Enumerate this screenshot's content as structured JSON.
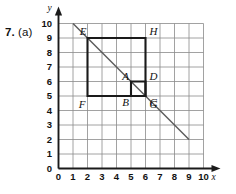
{
  "question": {
    "number": "7.",
    "part": "(a)"
  },
  "chart_data": {
    "type": "scatter",
    "title": "",
    "xlabel": "x",
    "ylabel": "y",
    "xlim": [
      0,
      10
    ],
    "ylim": [
      0,
      10
    ],
    "grid": true,
    "legend": "none",
    "xticks": [
      "0",
      "1",
      "2",
      "3",
      "4",
      "5",
      "6",
      "7",
      "8",
      "9",
      "10"
    ],
    "yticks": [
      "0",
      "1",
      "2",
      "3",
      "4",
      "5",
      "6",
      "7",
      "8",
      "9",
      "10"
    ],
    "shapes": [
      {
        "name": "square-EFGH",
        "kind": "square",
        "vertices": [
          {
            "label": "E",
            "x": 2,
            "y": 9
          },
          {
            "label": "H",
            "x": 6,
            "y": 9
          },
          {
            "label": "G",
            "x": 6,
            "y": 5
          },
          {
            "label": "F",
            "x": 2,
            "y": 5
          }
        ],
        "side": 4
      },
      {
        "name": "square-ABCD",
        "kind": "square",
        "vertices": [
          {
            "label": "A",
            "x": 5,
            "y": 6
          },
          {
            "label": "D",
            "x": 6,
            "y": 6
          },
          {
            "label": "C",
            "x": 6,
            "y": 5
          },
          {
            "label": "B",
            "x": 5,
            "y": 5
          }
        ],
        "side": 1
      }
    ],
    "lines": [
      {
        "name": "diagonal-line",
        "from": {
          "x": 1,
          "y": 10
        },
        "to": {
          "x": 9,
          "y": 2
        },
        "slope": -1,
        "intercept": 11
      }
    ],
    "point_labels": [
      {
        "label": "E",
        "x": 2,
        "y": 9
      },
      {
        "label": "H",
        "x": 6,
        "y": 9
      },
      {
        "label": "F",
        "x": 2,
        "y": 5
      },
      {
        "label": "G",
        "x": 6,
        "y": 5
      },
      {
        "label": "A",
        "x": 5,
        "y": 6
      },
      {
        "label": "D",
        "x": 6,
        "y": 6
      },
      {
        "label": "B",
        "x": 5,
        "y": 5
      },
      {
        "label": "C",
        "x": 6,
        "y": 5
      }
    ]
  },
  "colors": {
    "grid": "#8a8a8a",
    "axis": "#1a1a1a",
    "shape": "#1a1a1a",
    "line": "#5a5a5a",
    "background": "#ffffff"
  }
}
